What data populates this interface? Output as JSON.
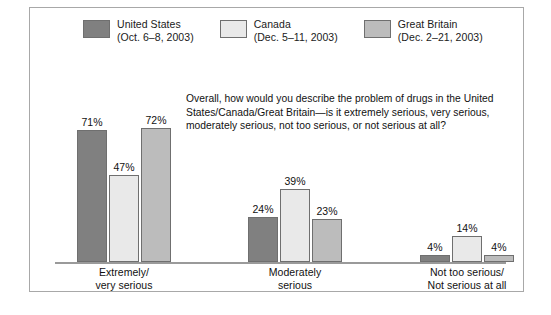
{
  "chart_data": {
    "type": "bar",
    "title": "",
    "subtitle": "",
    "xlabel": "",
    "ylabel": "",
    "ylim": [
      0,
      80
    ],
    "grid": false,
    "legend_position": "top",
    "annotation": "Overall, how would you describe the problem of drugs in the United States/Canada/Great Britain — is it extremely serious, very serious, moderately serious, not too serious, or not serious at all?",
    "categories": [
      "Extremely/ very serious",
      "Moderately serious",
      "Not too serious/ Not serious at all"
    ],
    "category_lines": [
      [
        "Extremely/",
        "very serious"
      ],
      [
        "Moderately",
        "serious"
      ],
      [
        "Not too serious/",
        "Not serious at all"
      ]
    ],
    "series": [
      {
        "name": "United States",
        "date": "(Oct. 6–8, 2003)",
        "color": "#808080",
        "values": [
          71,
          47,
          4
        ],
        "labels": [
          "71%",
          "47%",
          "4%"
        ]
      },
      {
        "name": "Canada",
        "date": "(Dec. 5–11, 2003)",
        "color": "#e9e9e9",
        "values": [
          47,
          39,
          14
        ],
        "labels": [
          "47%",
          "39%",
          "14%"
        ]
      },
      {
        "name": "Great Britain",
        "date": "(Dec. 2–21, 2003)",
        "color": "#bcbcbc",
        "values": [
          72,
          23,
          4
        ],
        "labels": [
          "72%",
          "23%",
          "4%"
        ]
      }
    ],
    "values_by_category": [
      {
        "category": "Extremely/ very serious",
        "United States": 71,
        "Canada": 47,
        "Great Britain": 72
      },
      {
        "category": "Moderately serious",
        "United States": 24,
        "Canada": 39,
        "Great Britain": 23
      },
      {
        "category": "Not too serious/ Not serious at all",
        "United States": 4,
        "Canada": 14,
        "Great Britain": 4
      }
    ]
  },
  "legend": {
    "items": [
      {
        "name": "United States",
        "date": "(Oct. 6–8, 2003)",
        "color": "#808080"
      },
      {
        "name": "Canada",
        "date": "(Dec. 5–11, 2003)",
        "color": "#e9e9e9"
      },
      {
        "name": "Great Britain",
        "date": "(Dec. 2–21, 2003)",
        "color": "#bcbcbc"
      }
    ]
  },
  "question": {
    "line1": "Overall, how would you describe the problem of drugs in the",
    "line2": "United States/Canada/Great Britain—is it extremely serious, very",
    "line3": "serious, moderately serious, not too serious, or not serious at all?"
  },
  "bars": {
    "g0s0": "71%",
    "g0s1": "47%",
    "g0s2": "72%",
    "g1s0": "24%",
    "g1s1": "39%",
    "g1s2": "23%",
    "g2s0": "4%",
    "g2s1": "14%",
    "g2s2": "4%"
  },
  "categories": {
    "c0l0": "Extremely/",
    "c0l1": "very serious",
    "c1l0": "Moderately",
    "c1l1": "serious",
    "c2l0": "Not too serious/",
    "c2l1": "Not serious at all"
  },
  "colors": {
    "united_states": "#808080",
    "canada": "#e9e9e9",
    "great_britain": "#bcbcbc",
    "bar_outline": "#6f6f6f",
    "baseline": "#9a9a9a",
    "frame": "#a8a8a8",
    "background": "#ffffff",
    "text": "#111111"
  }
}
